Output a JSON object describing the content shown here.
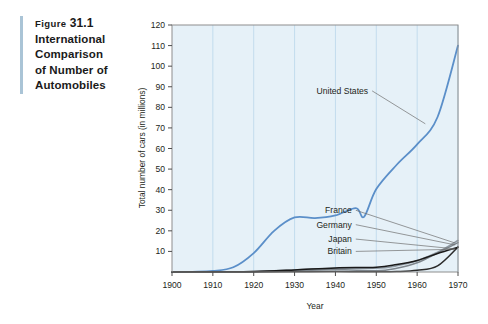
{
  "caption": {
    "figure_word": "Figure",
    "figure_number": "31.1",
    "lines": [
      "International",
      "Comparison",
      "of Number of",
      "Automobiles"
    ]
  },
  "chart_data": {
    "type": "line",
    "title": "",
    "xlabel": "Year",
    "ylabel": "Total number of cars (in millions)",
    "xlim": [
      1900,
      1970
    ],
    "ylim": [
      0,
      120
    ],
    "xticks": [
      1900,
      1910,
      1920,
      1930,
      1940,
      1950,
      1960,
      1970
    ],
    "yticks": [
      10,
      20,
      30,
      40,
      50,
      60,
      70,
      80,
      90,
      100,
      110,
      120
    ],
    "grid": "vertical",
    "legend_position": "inline-annotations",
    "plot_background": "#e6f1f8",
    "gridline_color": "#c3dced",
    "series": [
      {
        "name": "United States",
        "color": "#5b8fc9",
        "label_x": 1948,
        "label_y": 88,
        "x": [
          1900,
          1905,
          1910,
          1915,
          1920,
          1925,
          1930,
          1935,
          1940,
          1945,
          1947,
          1950,
          1955,
          1960,
          1965,
          1970
        ],
        "values": [
          0.0,
          0.1,
          0.5,
          2.3,
          9.2,
          20.0,
          26.5,
          26.2,
          27.5,
          31.0,
          26.8,
          40.3,
          52.1,
          62.0,
          75.3,
          110.0
        ]
      },
      {
        "name": "France",
        "color": "#8f9aa3",
        "label_x": 1944,
        "label_y": 30,
        "x": [
          1900,
          1910,
          1920,
          1930,
          1940,
          1950,
          1955,
          1960,
          1965,
          1970
        ],
        "values": [
          0.0,
          0.1,
          0.2,
          1.1,
          1.8,
          1.8,
          3.0,
          5.5,
          9.6,
          15.3
        ]
      },
      {
        "name": "Germany",
        "color": "#7d858c",
        "label_x": 1944,
        "label_y": 23,
        "x": [
          1900,
          1910,
          1920,
          1930,
          1940,
          1950,
          1955,
          1960,
          1965,
          1970
        ],
        "values": [
          0.0,
          0.05,
          0.1,
          0.5,
          1.2,
          0.6,
          1.8,
          4.5,
          9.3,
          14.3
        ]
      },
      {
        "name": "Japan",
        "color": "#2b2b2b",
        "label_x": 1944,
        "label_y": 16,
        "x": [
          1900,
          1910,
          1920,
          1930,
          1940,
          1950,
          1955,
          1960,
          1965,
          1970
        ],
        "values": [
          0.0,
          0.0,
          0.02,
          0.1,
          0.2,
          0.1,
          0.2,
          0.8,
          3.0,
          12.2
        ]
      },
      {
        "name": "Britain",
        "color": "#1a1a1a",
        "label_x": 1944,
        "label_y": 10,
        "x": [
          1900,
          1910,
          1920,
          1930,
          1940,
          1950,
          1955,
          1960,
          1965,
          1970
        ],
        "values": [
          0.0,
          0.1,
          0.2,
          1.0,
          2.0,
          2.3,
          3.6,
          5.6,
          9.0,
          12.0
        ]
      }
    ]
  }
}
